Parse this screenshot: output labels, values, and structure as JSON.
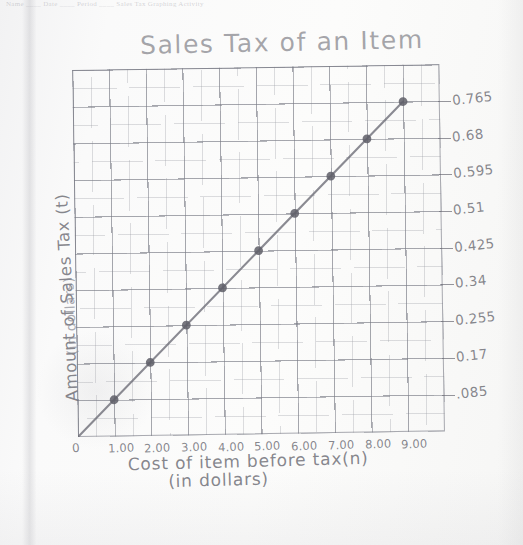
{
  "printed_header": "Name ____  Date ____  Period ____  Sales Tax Graphing Activity",
  "title": "Sales Tax of an Item",
  "axes": {
    "x_title_line1": "Cost of item before tax(n)",
    "x_title_line2": "(in dollars)",
    "y_title_line1": "Amount of Sales Tax (t)",
    "y_title_line2": "(in dollars)",
    "origin_label": "0"
  },
  "chart_data": {
    "type": "line",
    "title": "Sales Tax of an Item",
    "xlabel": "Cost of item before tax(n) (in dollars)",
    "ylabel": "Amount of Sales Tax (t) (in dollars)",
    "xlim": [
      0,
      10
    ],
    "ylim": [
      0,
      0.85
    ],
    "grid": true,
    "legend": "none",
    "x_tick_labels": [
      "0",
      "1.00",
      "2.00",
      "3.00",
      "4.00",
      "5.00",
      "6.00",
      "7.00",
      "8.00",
      "9.00"
    ],
    "x_tick_values": [
      0,
      1,
      2,
      3,
      4,
      5,
      6,
      7,
      8,
      9
    ],
    "y_tick_labels": [
      ".085",
      "0.17",
      "0.255",
      "0.34",
      "0.425",
      "0.51",
      "0.595",
      "0.68",
      "0.765"
    ],
    "y_tick_values": [
      0.085,
      0.17,
      0.255,
      0.34,
      0.425,
      0.51,
      0.595,
      0.68,
      0.765
    ],
    "series": [
      {
        "name": "Sales tax",
        "x": [
          1,
          2,
          3,
          4,
          5,
          6,
          7,
          8,
          9
        ],
        "values": [
          0.085,
          0.17,
          0.255,
          0.34,
          0.425,
          0.51,
          0.595,
          0.68,
          0.765
        ],
        "marker": "filled-circle",
        "line_from": [
          0,
          0
        ],
        "line_to": [
          9,
          0.765
        ]
      }
    ],
    "relationship": "t = 0.085n",
    "slope": 0.085
  },
  "colors": {
    "paper": "#fafafa",
    "grid_minor": "#96989f",
    "grid_major": "#787a84",
    "pencil": "#6c6c74"
  }
}
